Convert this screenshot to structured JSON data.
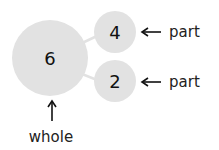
{
  "diagram": {
    "type": "number-bond",
    "whole": {
      "value": "6",
      "label": "whole"
    },
    "parts": [
      {
        "value": "4",
        "label": "part"
      },
      {
        "value": "2",
        "label": "part"
      }
    ],
    "colors": {
      "circle_fill": "#e2e2e2",
      "connector": "#e2e2e2",
      "text": "#111111",
      "arrow": "#111111"
    }
  }
}
